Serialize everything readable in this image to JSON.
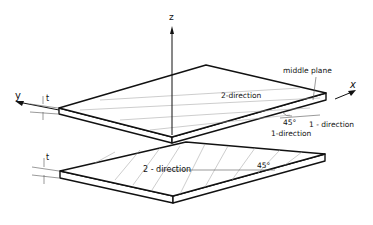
{
  "figure": {
    "type": "laminate-ply-geometry"
  },
  "axes": {
    "x_label": "x",
    "y_label": "y",
    "z_label": "z"
  },
  "thickness_labels": {
    "top_ply": "t",
    "bottom_ply": "t"
  },
  "top_ply": {
    "label_middle_plane": "middle plane",
    "label_2_direction": "2-direction",
    "label_1_direction_a": "1 - direction",
    "label_1_direction_b": "1-direction",
    "angle_label": "45°"
  },
  "bottom_ply": {
    "label_2_direction": "2 - direction",
    "angle_label": "45°"
  },
  "colors": {
    "line": "#111111",
    "hatch": "#9a9a9a",
    "background": "#ffffff"
  }
}
